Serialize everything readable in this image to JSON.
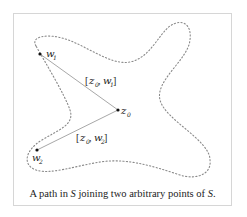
{
  "diagram": {
    "points": [
      {
        "id": "w1",
        "label": "w",
        "subscript": "1"
      },
      {
        "id": "z0",
        "label": "z",
        "subscript": "0"
      },
      {
        "id": "w2",
        "label": "w",
        "subscript": "2"
      }
    ],
    "segments": [
      {
        "from": "z0",
        "to": "w1",
        "label_parts": [
          "[",
          "z",
          "0",
          ", ",
          "w",
          "1",
          "]"
        ]
      },
      {
        "from": "z0",
        "to": "w2",
        "label_parts": [
          "[",
          "z",
          "0",
          ", ",
          "w",
          "2",
          "]"
        ]
      }
    ],
    "region_name": "S",
    "colors": {
      "outline": "#8a8a8a",
      "segment": "#a8a8a8",
      "point": "#111111",
      "frame": "#d6d6d6"
    }
  },
  "caption": {
    "before": "A path in ",
    "set1": "S",
    "middle": " joining two arbitrary points of ",
    "set2": "S",
    "after": "."
  }
}
